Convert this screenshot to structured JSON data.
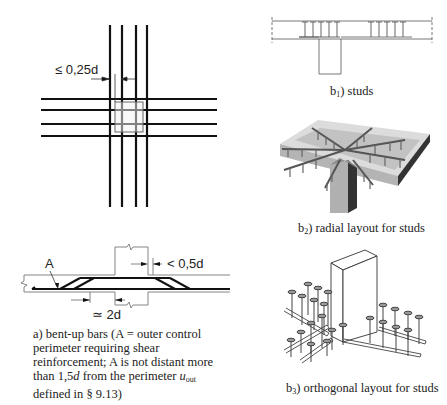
{
  "figure_a_plan": {
    "dimension_label": "≤ 0,25d"
  },
  "figure_a_section": {
    "label_A": "A",
    "dim_top": "< 0,5d",
    "dim_bottom": "≃ 2d"
  },
  "caption_a": {
    "prefix": "a)  bent-up bars (A = outer control perimeter requiring shear reinforcement; A is not distant more than 1,5",
    "italic_d": "d",
    "middle": " from the perimeter ",
    "italic_u": "u",
    "u_sub": "out",
    "suffix": " defined in § 9.13)"
  },
  "caption_b1": {
    "letter": "b",
    "sub": "1",
    "text": ")  studs"
  },
  "caption_b2": {
    "letter": "b",
    "sub": "2",
    "text": ") radial layout for studs"
  },
  "caption_b3": {
    "letter": "b",
    "sub": "3",
    "text": ") orthogonal layout for studs"
  },
  "colors": {
    "line": "#111111",
    "thin_line": "#555555",
    "slab_gray": "#b8b8b8",
    "slab_top": "#d4d4d4",
    "stud_gray": "#6a6a6a"
  }
}
